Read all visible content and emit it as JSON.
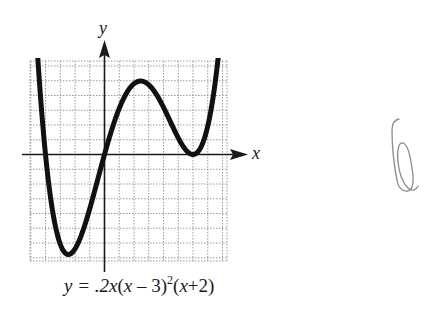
{
  "figure": {
    "x_axis_label": "x",
    "y_axis_label": "y",
    "equation": {
      "prefix": "y = .2",
      "x1": "x",
      "open1": "(",
      "x2": "x",
      "minus_part": " – 3)",
      "exponent": "2",
      "open2": "(",
      "x3": "x",
      "plus_part": "+2)"
    },
    "handwritten_mark": "6",
    "colors": {
      "curve": "#111111",
      "grid": "#9a9a9a",
      "axis": "#1a1a1a",
      "handwriting": "#8a8a8a"
    }
  },
  "chart_data": {
    "type": "line",
    "xlabel": "x",
    "ylabel": "y",
    "function": "0.2*x*(x-3)^2*(x+2)",
    "roots": [
      -2,
      0,
      3
    ],
    "local_max": {
      "x": 1.17,
      "y": 2.48
    },
    "local_min": {
      "x": -1.37,
      "y": -3.23
    },
    "double_root": 3,
    "grid": true,
    "grid_step": 0.5,
    "xlim": [
      -2.55,
      4.1
    ],
    "ylim": [
      -3.55,
      3.15
    ],
    "x": [
      -2.4,
      -2.2,
      -2.0,
      -1.8,
      -1.6,
      -1.4,
      -1.2,
      -1.0,
      -0.8,
      -0.6,
      -0.4,
      -0.2,
      0.0,
      0.4,
      0.8,
      1.2,
      1.6,
      2.0,
      2.4,
      2.8,
      3.0,
      3.2,
      3.6,
      4.0
    ],
    "series": [
      {
        "name": "y = .2x(x-3)^2(x+2)",
        "values": [
          3.61,
          2.26,
          0.0,
          -1.68,
          -2.7,
          -3.23,
          -3.33,
          -3.2,
          -2.92,
          -2.43,
          -1.87,
          -1.2,
          0.0,
          1.36,
          2.25,
          2.47,
          2.25,
          1.6,
          0.89,
          0.23,
          0.0,
          0.13,
          1.45,
          4.8
        ]
      }
    ]
  }
}
